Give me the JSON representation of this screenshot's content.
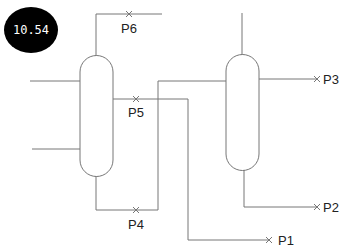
{
  "badge": {
    "value": "10.54"
  },
  "ports": {
    "p1": "P1",
    "p2": "P2",
    "p3": "P3",
    "p4": "P4",
    "p5": "P5",
    "p6": "P6"
  },
  "colors": {
    "line": "#777777",
    "badge_bg": "#000000",
    "badge_text": "#ffffff"
  }
}
